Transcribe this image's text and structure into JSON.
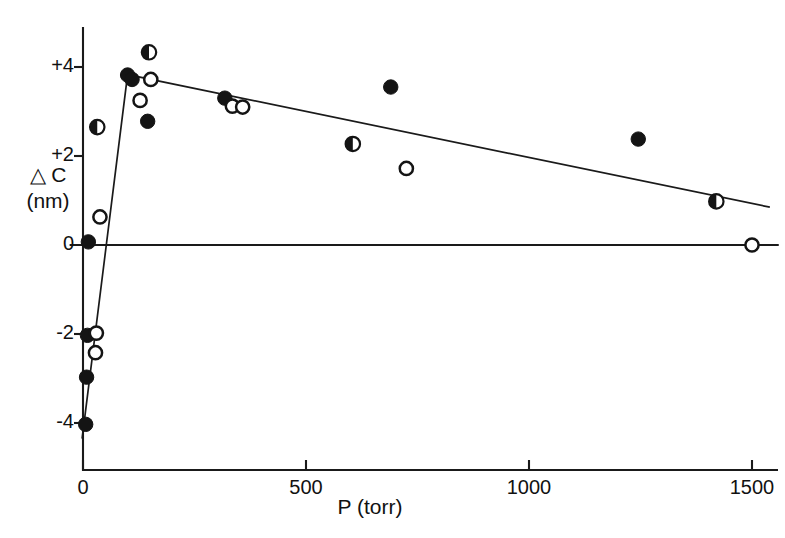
{
  "chart_data": {
    "type": "scatter",
    "title": "",
    "xlabel": "P  (torr)",
    "ylabel_line1": "△ C",
    "ylabel_line2": "(nm)",
    "xlim": [
      -30,
      1560
    ],
    "ylim": [
      -4.9,
      4.9
    ],
    "xticks": [
      0,
      500,
      1000,
      1500
    ],
    "xticklabels": [
      "0",
      "500",
      "1000",
      "1500"
    ],
    "yticks": [
      4,
      2,
      0,
      -2,
      -4
    ],
    "yticklabels": [
      "+4",
      "+2",
      "0",
      "-2",
      "-4"
    ],
    "grid": false,
    "legend": "none",
    "zero_line": {
      "y": 0,
      "x_from": -30,
      "x_to": 1560
    },
    "series": [
      {
        "name": "filled-circle",
        "marker": "filled",
        "points": [
          [
            12,
            0.07
          ],
          [
            10,
            -2.03
          ],
          [
            8,
            -2.97
          ],
          [
            6,
            -4.03
          ],
          [
            100,
            3.82
          ],
          [
            110,
            3.72
          ],
          [
            145,
            2.78
          ],
          [
            318,
            3.3
          ],
          [
            690,
            3.55
          ],
          [
            1245,
            2.38
          ]
        ]
      },
      {
        "name": "open-circle",
        "marker": "open",
        "points": [
          [
            38,
            0.63
          ],
          [
            30,
            -1.98
          ],
          [
            28,
            -2.42
          ],
          [
            128,
            3.25
          ],
          [
            152,
            3.72
          ],
          [
            335,
            3.12
          ],
          [
            358,
            3.1
          ],
          [
            725,
            1.72
          ],
          [
            1500,
            0.0
          ]
        ]
      },
      {
        "name": "half-filled-circle",
        "marker": "half",
        "points": [
          [
            32,
            2.65
          ],
          [
            148,
            4.33
          ],
          [
            605,
            2.27
          ],
          [
            1420,
            0.98
          ]
        ]
      }
    ],
    "fit_line": {
      "name": "fitted-curve",
      "vertices": [
        [
          -2,
          -4.35
        ],
        [
          100,
          3.83
        ],
        [
          1540,
          0.85
        ]
      ]
    }
  },
  "axis": {
    "x_tick_labels": [
      "0",
      "500",
      "1000",
      "1500"
    ],
    "y_tick_labels": [
      "+4",
      "+2",
      "0",
      "-2",
      "-4"
    ],
    "x_axis_title": "P  (torr)",
    "y_axis_title_top": "△ C",
    "y_axis_title_bottom": "(nm)"
  }
}
